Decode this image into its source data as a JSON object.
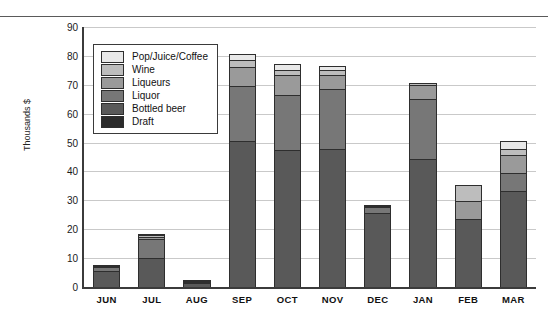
{
  "chart_data": {
    "type": "bar",
    "subtype": "stacked-bar",
    "title": "",
    "xlabel": "",
    "ylabel": "Thousands $",
    "ylim": [
      0,
      90
    ],
    "ytick_step": 10,
    "yticks": [
      "90",
      "80",
      "70",
      "60",
      "50",
      "40",
      "30",
      "20",
      "10",
      "0"
    ],
    "grid": true,
    "legend_position": "upper-left-inside",
    "categories": [
      "JUN",
      "JUL",
      "AUG",
      "SEP",
      "OCT",
      "NOV",
      "DEC",
      "JAN",
      "FEB",
      "MAR"
    ],
    "series": [
      {
        "name": "Draft",
        "color": "#2b2b2b",
        "values": [
          0,
          0,
          0,
          0,
          0,
          0,
          0,
          0,
          0,
          0
        ]
      },
      {
        "name": "Bottled beer",
        "color": "#595959",
        "values": [
          5.5,
          10.0,
          1.3,
          50.0,
          47.0,
          47.5,
          25.5,
          44.0,
          23.5,
          33.0
        ]
      },
      {
        "name": "Liquor",
        "color": "#777777",
        "values": [
          1.5,
          6.5,
          0.2,
          19.0,
          19.0,
          20.5,
          2.0,
          20.5,
          0.0,
          6.0
        ]
      },
      {
        "name": "Liqueurs",
        "color": "#9a9a9a",
        "values": [
          0.3,
          0.7,
          0.1,
          6.5,
          7.0,
          5.0,
          0.3,
          5.0,
          6.0,
          6.5
        ]
      },
      {
        "name": "Wine",
        "color": "#bdbdbd",
        "values": [
          0.2,
          0.5,
          0.1,
          2.5,
          1.5,
          1.5,
          0.2,
          0.5,
          5.5,
          2.0
        ]
      },
      {
        "name": "Pop/Juice/Coffee",
        "color": "#e8e8e8",
        "values": [
          0.0,
          0.3,
          0.0,
          2.0,
          2.0,
          1.5,
          0.0,
          0.0,
          0.0,
          2.5
        ]
      }
    ],
    "totals": [
      7.5,
      18.0,
      1.7,
      80.0,
      76.5,
      76.0,
      28.0,
      70.0,
      35.0,
      50.0
    ]
  },
  "legend": {
    "items": [
      {
        "label": "Pop/Juice/Coffee",
        "color": "#e8e8e8"
      },
      {
        "label": "Wine",
        "color": "#bdbdbd"
      },
      {
        "label": "Liqueurs",
        "color": "#9a9a9a"
      },
      {
        "label": "Liquor",
        "color": "#777777"
      },
      {
        "label": "Bottled beer",
        "color": "#595959"
      },
      {
        "label": "Draft",
        "color": "#2b2b2b"
      }
    ]
  },
  "axis": {
    "y_title": "Thousands $"
  }
}
